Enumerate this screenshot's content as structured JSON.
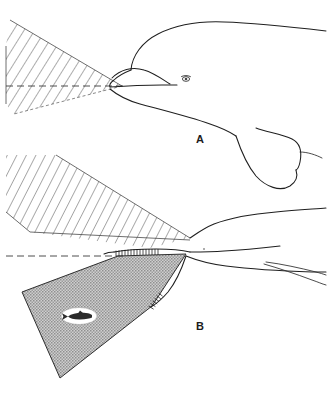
{
  "figure": {
    "kind": "scientific-line-drawing",
    "background_color": "#ffffff",
    "ink_color": "#1f1f1f",
    "width": 328,
    "height": 410
  },
  "panels": [
    {
      "id": "A",
      "label": "A",
      "label_x": 196,
      "label_y": 143,
      "view": "lateral view of head and body with forward hatched sound beam",
      "beam": {
        "style": "diagonal-hatch",
        "fill": "none",
        "hatch_color": "#3a3a3a",
        "apex_x": 120,
        "apex_y": 86,
        "upper_edge_end_x": 8,
        "upper_edge_end_y": 22,
        "lower_edge_end_x": 10,
        "lower_edge_end_y": 112
      },
      "axis_line": {
        "style": "dashed",
        "y": 86,
        "x_start": 6,
        "x_end": 124
      }
    },
    {
      "id": "B",
      "label": "B",
      "label_x": 196,
      "label_y": 330,
      "view": "second view with upper hatched beam and lower shaded beam containing prey",
      "beams": [
        {
          "style": "diagonal-hatch",
          "fill": "none",
          "hatch_color": "#3a3a3a",
          "apex_x": 190,
          "apex_y": 238,
          "note": "upper beam"
        },
        {
          "style": "stipple-shaded",
          "fill": "#b9b9b9",
          "edge_color": "#2e2e2e",
          "apex_x": 186,
          "apex_y": 254,
          "note": "lower beam directed at prey"
        }
      ],
      "axis_line": {
        "style": "dashed",
        "y": 256,
        "x_start": 6,
        "x_end": 122
      },
      "prey": {
        "name": "fish-target",
        "x": 79,
        "y": 316,
        "halo": "white ellipse highlight",
        "orientation": "facing left"
      }
    }
  ],
  "annotations": {
    "jaw_ticks_label": "toothed jaw margin",
    "eye_label": "eye"
  },
  "colors": {
    "ink": "#1f1f1f",
    "hatch": "#3a3a3a",
    "beam_shade": "#b9b9b9",
    "dash": "#3a3a3a",
    "paper": "#ffffff"
  }
}
